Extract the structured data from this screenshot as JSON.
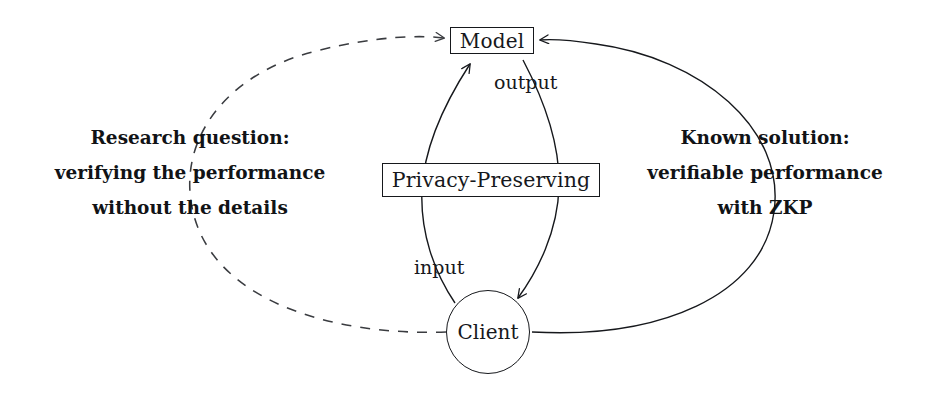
{
  "diagram": {
    "type": "flow-diagram",
    "background_color": "#ffffff",
    "stroke_color": "#16181c",
    "nodes": {
      "model": {
        "label": "Model",
        "shape": "rectangle"
      },
      "privacy": {
        "label": "Privacy-Preserving",
        "shape": "rectangle"
      },
      "client": {
        "label": "Client",
        "shape": "circle"
      }
    },
    "edges": {
      "input_label": "input",
      "output_label": "output",
      "left_loop_style": "dashed",
      "right_loop_style": "solid"
    },
    "annotations": {
      "left": {
        "line1": "Research question:",
        "line2": "verifying the performance",
        "line3": "without the details"
      },
      "right": {
        "line1": "Known solution:",
        "line2": "verifiable performance",
        "line3": "with ZKP"
      }
    }
  }
}
